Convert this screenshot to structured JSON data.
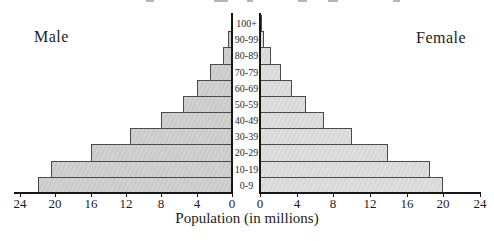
{
  "side_labels": {
    "male": "Male",
    "female": "Female"
  },
  "axis": {
    "xlabel": "Population (in millions)"
  },
  "chart_data": {
    "type": "bar",
    "variant": "population_pyramid",
    "title": "",
    "xlabel": "Population (in millions)",
    "categories_top_to_bottom": [
      "100+",
      "90-99",
      "80-89",
      "70-79",
      "60-69",
      "50-59",
      "40-49",
      "30-39",
      "20-29",
      "10-19",
      "0-9"
    ],
    "series": [
      {
        "name": "Male",
        "side": "left",
        "values": [
          0.1,
          0.4,
          1.0,
          2.5,
          4.0,
          5.5,
          8.0,
          11.5,
          16.0,
          20.5,
          22.0
        ]
      },
      {
        "name": "Female",
        "side": "right",
        "values": [
          0.1,
          0.4,
          1.2,
          2.3,
          3.5,
          5.0,
          7.0,
          10.0,
          14.0,
          18.5,
          20.0
        ]
      }
    ],
    "xlim": [
      0,
      24
    ],
    "tick_values": [
      0,
      4,
      8,
      12,
      16,
      20,
      24
    ],
    "grid": false,
    "legend_position": "top-corners",
    "colors": {
      "male_bar": "#cccccc",
      "female_bar": "#dadada",
      "bar_border": "#4a4a4a",
      "axis": "#161616"
    }
  }
}
